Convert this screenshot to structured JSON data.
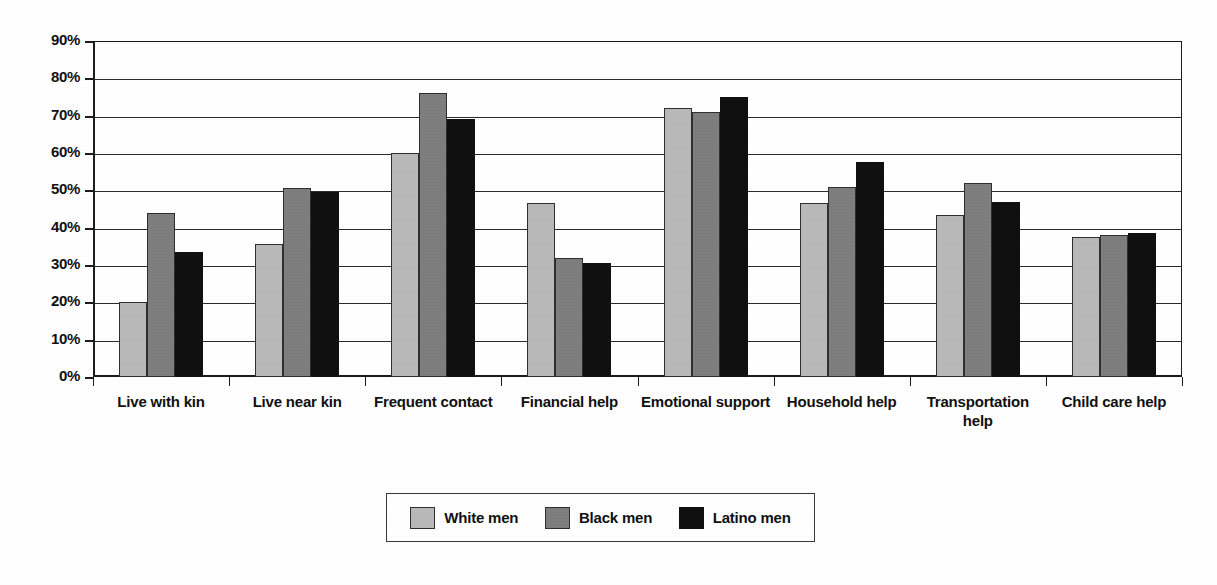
{
  "chart_data": {
    "type": "bar",
    "title": "",
    "subtitle": "",
    "xlabel": "",
    "ylabel": "",
    "ylim": [
      0,
      90
    ],
    "ytick_step": 10,
    "grid": true,
    "grid_axis": "y",
    "legend_position": "bottom-center",
    "categories": [
      "Live with kin",
      "Live near kin",
      "Frequent contact",
      "Financial help",
      "Emotional support",
      "Household help",
      "Transportation help",
      "Child care help"
    ],
    "ytick_labels": [
      "90%",
      "80%",
      "70%",
      "60%",
      "50%",
      "40%",
      "30%",
      "20%",
      "10%",
      "0%"
    ],
    "ytick_values": [
      90,
      80,
      70,
      60,
      50,
      40,
      30,
      20,
      10,
      0
    ],
    "series": [
      {
        "name": "White men",
        "color": "#b9b9b9",
        "values": [
          20,
          35.5,
          60,
          46.5,
          72,
          46.5,
          43.5,
          37.5
        ]
      },
      {
        "name": "Black men",
        "color": "#7e7e7e",
        "values": [
          44,
          50.5,
          76,
          32,
          71,
          51,
          52,
          38
        ]
      },
      {
        "name": "Latino men",
        "color": "#101010",
        "values": [
          33.5,
          49.5,
          69,
          30.5,
          75,
          57.5,
          47,
          38.5
        ]
      }
    ]
  },
  "legend": {
    "entries": [
      {
        "label": "White men",
        "swatch": "white-men"
      },
      {
        "label": "Black men",
        "swatch": "black-men"
      },
      {
        "label": "Latino men",
        "swatch": "latino-men"
      }
    ]
  },
  "colors": {
    "white_men": "#b9b9b9",
    "black_men": "#7e7e7e",
    "latino_men": "#101010",
    "axis": "#1c1c1c",
    "gridline": "#2b2b2b",
    "background": "#ffffff"
  }
}
